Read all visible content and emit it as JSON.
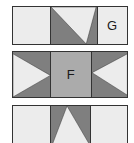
{
  "figure": {
    "name": "three-band-triangle-pattern",
    "colors": {
      "light": "#ececec",
      "dark": "#7f7f7f",
      "medium": "#ababab",
      "outline": "#333333",
      "background": "#ffffff",
      "label_text": "#1a1a1a"
    },
    "bands": [
      {
        "id": "band-1",
        "cells": [
          {
            "id": "b1-cell-1",
            "fill": "light",
            "label": "",
            "shape": "none"
          },
          {
            "id": "b1-cell-2",
            "fill": "dark",
            "label": "",
            "shape": "triangle-down"
          },
          {
            "id": "b1-cell-3",
            "fill": "light",
            "label": "G",
            "shape": "none"
          }
        ]
      },
      {
        "id": "band-2",
        "cells": [
          {
            "id": "b2-cell-1",
            "fill": "dark",
            "label": "",
            "shape": "triangle-right"
          },
          {
            "id": "b2-cell-2",
            "fill": "medium",
            "label": "F",
            "shape": "none"
          },
          {
            "id": "b2-cell-3",
            "fill": "dark",
            "label": "",
            "shape": "triangle-left"
          }
        ]
      },
      {
        "id": "band-3",
        "cells": [
          {
            "id": "b3-cell-1",
            "fill": "light",
            "label": "",
            "shape": "none"
          },
          {
            "id": "b3-cell-2",
            "fill": "dark",
            "label": "",
            "shape": "triangle-up"
          },
          {
            "id": "b3-cell-3",
            "fill": "light",
            "label": "",
            "shape": "none"
          }
        ]
      }
    ]
  }
}
